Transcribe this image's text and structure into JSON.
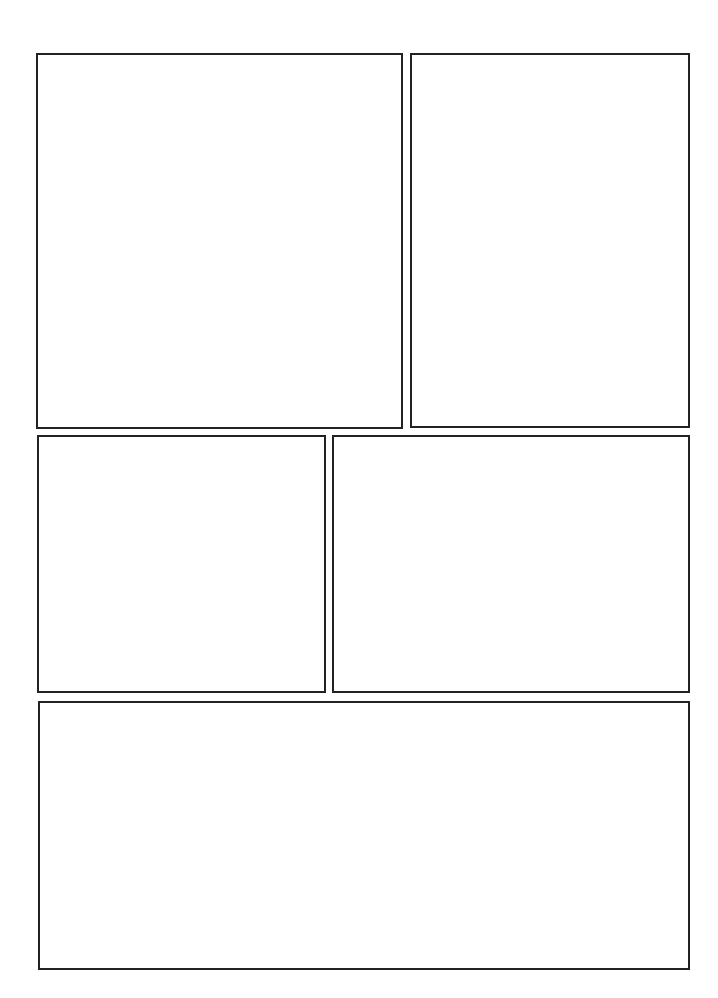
{
  "page": {
    "type": "comic-page-template",
    "background": "#ffffff",
    "border_color": "#222222",
    "panel_count": 5
  },
  "panels": [
    {
      "id": "panel-1",
      "row": 1,
      "position": "top-left",
      "content": ""
    },
    {
      "id": "panel-2",
      "row": 1,
      "position": "top-right",
      "content": ""
    },
    {
      "id": "panel-3",
      "row": 2,
      "position": "middle-left",
      "content": ""
    },
    {
      "id": "panel-4",
      "row": 2,
      "position": "middle-right",
      "content": ""
    },
    {
      "id": "panel-5",
      "row": 3,
      "position": "bottom-wide",
      "content": ""
    }
  ]
}
